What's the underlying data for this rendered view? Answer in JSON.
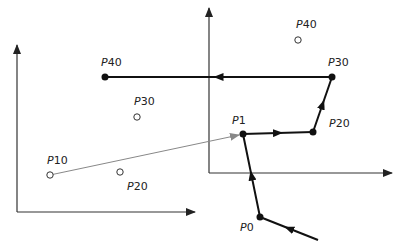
{
  "diagram": {
    "title": "",
    "colors": {
      "path": "#111111",
      "axis": "#333333",
      "gray_arrow": "#888888",
      "open_circle": "#333333"
    },
    "axes": [
      {
        "name": "left-axes",
        "origin": [
          17,
          212
        ],
        "y_top": [
          17,
          45
        ],
        "x_right": [
          195,
          212
        ]
      },
      {
        "name": "right-axes",
        "origin": [
          209,
          173
        ],
        "y_top": [
          209,
          8
        ],
        "x_right": [
          392,
          173
        ]
      }
    ],
    "open_points": [
      {
        "label_p": "P",
        "label_n": "10",
        "x": 50,
        "y": 175,
        "lx": 47,
        "ly": 164
      },
      {
        "label_p": "P",
        "label_n": "20",
        "x": 120,
        "y": 172,
        "lx": 127,
        "ly": 190
      },
      {
        "label_p": "P",
        "label_n": "30",
        "x": 137,
        "y": 117,
        "lx": 134,
        "ly": 105
      },
      {
        "label_p": "P",
        "label_n": "40",
        "x": 298,
        "y": 40,
        "lx": 296,
        "ly": 28
      }
    ],
    "filled_points": [
      {
        "label_p": "P",
        "label_n": "0",
        "x": 260,
        "y": 217,
        "lx": 240,
        "ly": 231
      },
      {
        "label_p": "P",
        "label_n": "1",
        "x": 243,
        "y": 134,
        "lx": 232,
        "ly": 124
      },
      {
        "label_p": "P",
        "label_n": "20",
        "x": 313,
        "y": 132,
        "lx": 329,
        "ly": 127
      },
      {
        "label_p": "P",
        "label_n": "30",
        "x": 332,
        "y": 77,
        "lx": 328,
        "ly": 66
      },
      {
        "label_p": "P",
        "label_n": "40",
        "x": 105,
        "y": 77,
        "lx": 101,
        "ly": 66
      }
    ],
    "path": [
      [
        318,
        240
      ],
      [
        260,
        217
      ],
      [
        243,
        134
      ],
      [
        313,
        132
      ],
      [
        332,
        77
      ],
      [
        105,
        77
      ]
    ],
    "gray_arrow": {
      "from": [
        50,
        175
      ],
      "to": [
        243,
        134
      ]
    }
  }
}
